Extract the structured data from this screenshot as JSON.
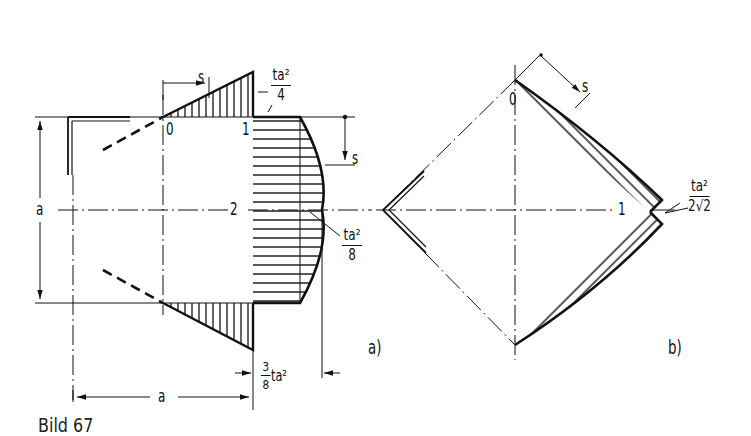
{
  "figure": {
    "caption": "Bild 67",
    "panel_a": {
      "label": "a)",
      "points": {
        "p0": "0",
        "p1": "1",
        "p2": "2"
      },
      "dimension_height": "a",
      "dimension_width": "a",
      "coordinate_s_top": "s",
      "coordinate_s_right": "s",
      "value_top": {
        "numerator": "ta²",
        "denominator": "4"
      },
      "value_mid": {
        "numerator": "ta²",
        "denominator": "8"
      },
      "offset_value": {
        "numerator": "3",
        "denominator": "8",
        "suffix": "ta²"
      }
    },
    "panel_b": {
      "label": "b)",
      "points": {
        "p0": "0",
        "p1": "1"
      },
      "coordinate_s": "s",
      "value": {
        "numerator": "ta²",
        "denominator": "2√2"
      }
    }
  }
}
